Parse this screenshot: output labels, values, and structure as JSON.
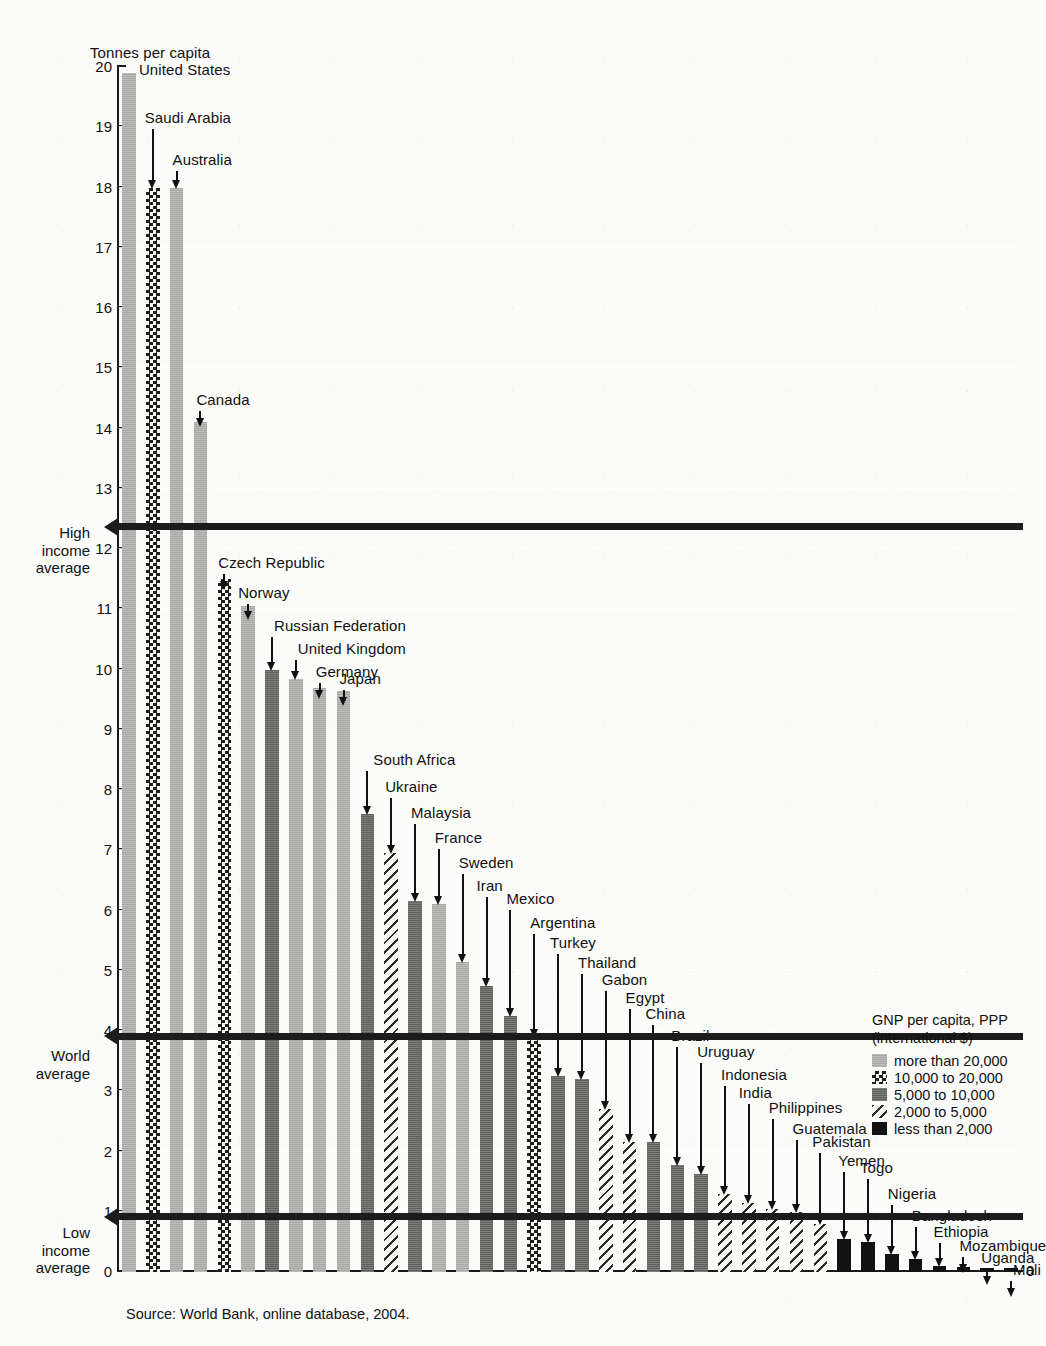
{
  "chart_data": {
    "type": "bar",
    "title": "",
    "ylabel": "Tonnes per capita",
    "xlabel": "",
    "ylim": [
      0,
      20
    ],
    "grid": true,
    "legend_position": "bottom-right",
    "source": "Source: World Bank, online database, 2004.",
    "y_ticks": [
      "0",
      "1",
      "2",
      "3",
      "4",
      "5",
      "6",
      "7",
      "8",
      "9",
      "10",
      "11",
      "12",
      "13",
      "14",
      "15",
      "16",
      "17",
      "18",
      "19",
      "20"
    ],
    "zero_right_label": "0",
    "legend": {
      "title_line1": "GNP per capita, PPP",
      "title_line2": "(international $)",
      "entries": [
        {
          "key": "more20",
          "label": "more than 20,000",
          "pattern": "light-gray-solid"
        },
        {
          "key": "b10to20",
          "label": "10,000 to 20,000",
          "pattern": "checkerboard"
        },
        {
          "key": "b5to10",
          "label": "5,000 to 10,000",
          "pattern": "dark-gray-solid"
        },
        {
          "key": "b2to5",
          "label": "2,000 to 5,000",
          "pattern": "diagonal-hatch"
        },
        {
          "key": "less2",
          "label": "less than 2,000",
          "pattern": "black-solid"
        }
      ]
    },
    "reference_lines": [
      {
        "key": "high",
        "label_lines": [
          "High",
          "income",
          "average"
        ],
        "value": 12.35
      },
      {
        "key": "world",
        "label_lines": [
          "World",
          "average"
        ],
        "value": 3.9
      },
      {
        "key": "low",
        "label_lines": [
          "Low",
          "income",
          "average"
        ],
        "value": 0.9
      }
    ],
    "categories": [
      "United States",
      "Saudi Arabia",
      "Australia",
      "Canada",
      "Czech Republic",
      "Norway",
      "Russian Federation",
      "United Kingdom",
      "Germany",
      "Japan",
      "South Africa",
      "Ukraine",
      "Malaysia",
      "France",
      "Sweden",
      "Iran",
      "Mexico",
      "Argentina",
      "Turkey",
      "Thailand",
      "Gabon",
      "Egypt",
      "China",
      "Brazil",
      "Uruguay",
      "Indonesia",
      "India",
      "Philippines",
      "Guatemala",
      "Pakistan",
      "Yemen",
      "Togo",
      "Nigeria",
      "Bangladesh",
      "Ethiopia",
      "Mozambique",
      "Uganda",
      "Mali"
    ],
    "values": [
      19.9,
      18.0,
      18.0,
      14.1,
      11.5,
      11.05,
      10.0,
      9.85,
      9.7,
      9.65,
      7.6,
      6.95,
      6.15,
      6.1,
      5.15,
      4.75,
      4.25,
      3.9,
      3.25,
      3.2,
      2.7,
      2.15,
      2.15,
      1.78,
      1.62,
      1.3,
      1.15,
      1.05,
      1.0,
      0.8,
      0.55,
      0.5,
      0.3,
      0.22,
      0.1,
      0.08,
      0.07,
      0.06
    ],
    "income_group": [
      "more20",
      "b10to20",
      "more20",
      "more20",
      "b10to20",
      "more20",
      "b5to10",
      "more20",
      "more20",
      "more20",
      "b5to10",
      "b2to5",
      "b5to10",
      "more20",
      "more20",
      "b5to10",
      "b5to10",
      "b10to20",
      "b5to10",
      "b5to10",
      "b2to5",
      "b2to5",
      "b5to10",
      "b5to10",
      "b5to10",
      "b2to5",
      "b2to5",
      "b2to5",
      "b2to5",
      "b2to5",
      "less2",
      "less2",
      "less2",
      "less2",
      "less2",
      "less2",
      "less2",
      "less2"
    ]
  }
}
